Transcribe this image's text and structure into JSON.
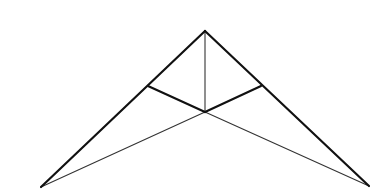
{
  "diagram": {
    "type": "truss",
    "background": "#ffffff",
    "points": {
      "apex": {
        "x": 205,
        "y": 31
      },
      "left_joint": {
        "x": 148,
        "y": 86
      },
      "center": {
        "x": 205,
        "y": 112
      },
      "right_joint": {
        "x": 261,
        "y": 86
      },
      "left_base": {
        "x": 41,
        "y": 187
      },
      "right_base": {
        "x": 369,
        "y": 186
      }
    },
    "members": [
      {
        "name": "left-rafter",
        "from": "left_base",
        "to": "apex",
        "weight": "thick"
      },
      {
        "name": "right-rafter",
        "from": "apex",
        "to": "right_base",
        "weight": "thick"
      },
      {
        "name": "left-web",
        "from": "left_joint",
        "to": "center",
        "weight": "thick"
      },
      {
        "name": "right-web",
        "from": "right_joint",
        "to": "center",
        "weight": "thick"
      },
      {
        "name": "king-post",
        "from": "apex",
        "to": "center",
        "weight": "thin"
      },
      {
        "name": "left-bottom-chord",
        "from": "left_base",
        "to": "center",
        "weight": "thin"
      },
      {
        "name": "right-bottom-chord",
        "from": "center",
        "to": "right_base",
        "weight": "thin"
      }
    ],
    "colors": {
      "thick_stroke": "#111111",
      "thin_stroke": "#333333"
    }
  }
}
